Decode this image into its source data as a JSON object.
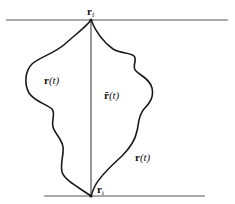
{
  "diagram": {
    "type": "path-integral-trajectories",
    "boundaries": {
      "top_line": {
        "x1": 6,
        "x2": 228,
        "y": 20
      },
      "bottom_line": {
        "x1": 44,
        "x2": 205,
        "y": 196
      }
    },
    "points": {
      "final": {
        "symbol": "r",
        "subscript": "f",
        "x": 91,
        "y": 20
      },
      "initial": {
        "symbol": "r",
        "subscript": "i",
        "x": 91,
        "y": 196
      }
    },
    "paths": {
      "classical": {
        "label_symbol": "r̄",
        "label_arg": "(t)",
        "style": "straight"
      },
      "left": {
        "label_symbol": "r",
        "label_arg": "(t)",
        "style": "wiggly"
      },
      "right": {
        "label_symbol": "r",
        "label_arg": "(t)",
        "style": "wiggly"
      }
    },
    "colors": {
      "stroke": "#1a1a1a",
      "baseline": "#555555",
      "background": "#ffffff"
    }
  }
}
